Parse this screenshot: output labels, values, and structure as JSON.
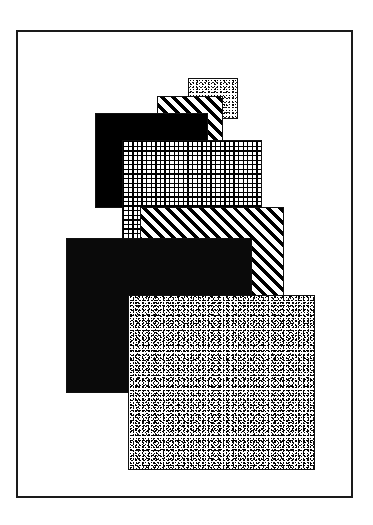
{
  "figure": {
    "background_color": "#ffffff",
    "frame": {
      "border_color": "#1a1a1a",
      "border_width_px": 2,
      "x": 16,
      "y": 30,
      "width": 337,
      "height": 468
    },
    "patches": [
      {
        "id": "patch-speckle-small",
        "label": "Fine speckle square",
        "pattern": "speckle-fine",
        "fill_color": "#ffffff",
        "ink_color": "#000000",
        "x": 188,
        "y": 78,
        "width": 50,
        "height": 41,
        "z": 1
      },
      {
        "id": "patch-diagonal-small",
        "label": "Diagonal stripe square (small)",
        "pattern": "diagonal-stripe-45",
        "fill_color": "#ffffff",
        "ink_color": "#000000",
        "x": 157,
        "y": 96,
        "width": 66,
        "height": 46,
        "z": 2
      },
      {
        "id": "patch-checker-dark",
        "label": "Dark checkerboard square",
        "pattern": "checker-dark",
        "fill_color": "#000000",
        "ink_color": "#ffffff",
        "x": 95,
        "y": 113,
        "width": 113,
        "height": 95,
        "z": 3
      },
      {
        "id": "patch-grid-light",
        "label": "Light dotted grid square",
        "pattern": "grid-light",
        "fill_color": "#ffffff",
        "ink_color": "#000000",
        "x": 122,
        "y": 140,
        "width": 140,
        "height": 100,
        "z": 4
      },
      {
        "id": "patch-diagonal-large",
        "label": "Diagonal stripe square (large)",
        "pattern": "diagonal-stripe-45",
        "fill_color": "#ffffff",
        "ink_color": "#000000",
        "x": 140,
        "y": 207,
        "width": 144,
        "height": 92,
        "z": 5
      },
      {
        "id": "patch-solid-black",
        "label": "Solid black square",
        "pattern": "solid-black",
        "fill_color": "#0a0a0a",
        "ink_color": "#0a0a0a",
        "x": 66,
        "y": 238,
        "width": 186,
        "height": 155,
        "z": 6
      },
      {
        "id": "patch-speckle-large",
        "label": "Dense speckle square",
        "pattern": "speckle-dense",
        "fill_color": "#ffffff",
        "ink_color": "#000000",
        "x": 128,
        "y": 295,
        "width": 187,
        "height": 175,
        "z": 7
      }
    ]
  }
}
